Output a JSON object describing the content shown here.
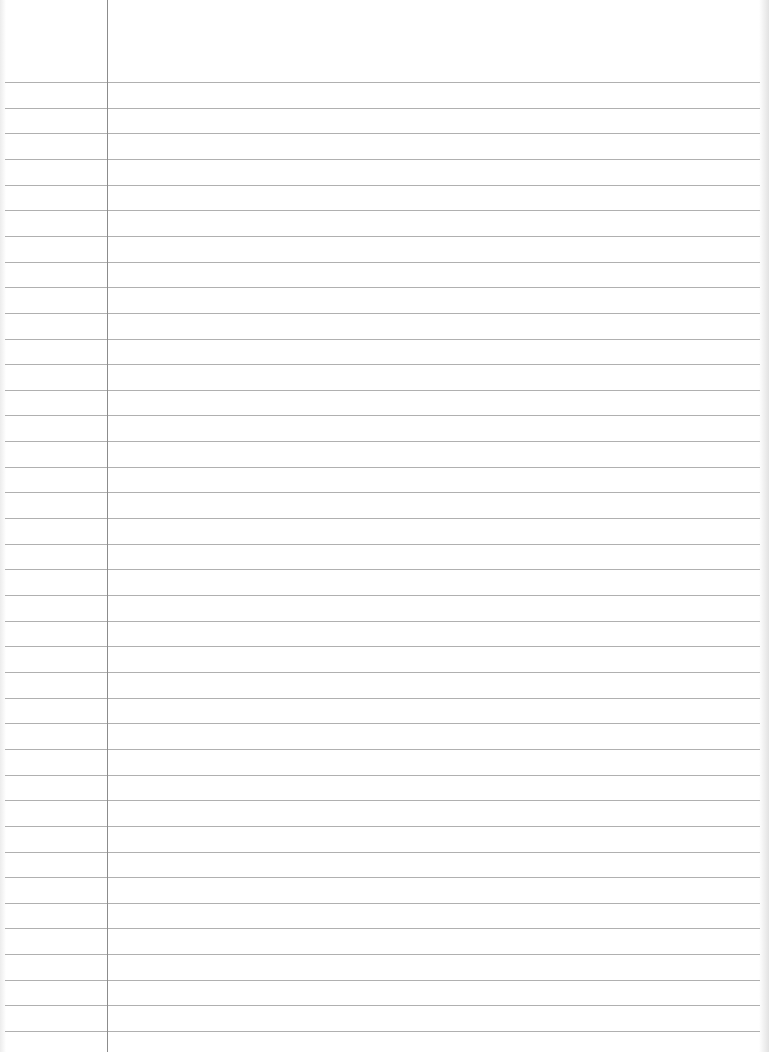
{
  "page": {
    "type": "lined-paper",
    "background_color": "#ffffff",
    "rule_color": "#b0b0b0",
    "margin_color": "#8c8c8c"
  },
  "rules": {
    "count": 38,
    "first_y": 82,
    "spacing": 25.65,
    "left_x": 5,
    "right_x": 760
  },
  "margin": {
    "x": 107,
    "top": 0,
    "bottom": 1052
  }
}
